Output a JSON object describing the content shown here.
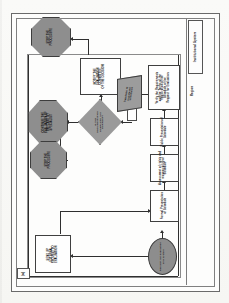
{
  "figure": {
    "number_label": "(a)",
    "orientation": "rotated-90-ccw",
    "type": "swimlane-flowchart"
  },
  "lanes": {
    "header_label": "Institutional System",
    "region_label": "Region"
  },
  "nodes": [
    {
      "id": "stop-top",
      "shape": "octagon",
      "fill": "#8e8e8e",
      "lines": [
        "STOP THE",
        "PROCEDURE"
      ]
    },
    {
      "id": "stop-mid-upper",
      "shape": "octagon",
      "fill": "#8e8e8e",
      "lines": [
        "CONTINUE THE",
        "EVALUATION OF",
        "THE CASE BY",
        "SPECIALIST"
      ]
    },
    {
      "id": "stop-mid-lower",
      "shape": "octagon",
      "fill": "#8e8e8e",
      "lines": [
        "STOP THE",
        "PROCEDURE"
      ]
    },
    {
      "id": "decision",
      "shape": "diamond",
      "fill": "#9a9a9a",
      "lines": [
        "IS THE",
        "DOCUMENTATION",
        "COMPLETE AND",
        "CORRECT?"
      ]
    },
    {
      "id": "notify-box",
      "shape": "rectangle",
      "fill": "#fefefe",
      "lines": [
        "NOTIFY THE",
        "EVALUATION",
        "COMMITTEE",
        "OF THE DECISION"
      ]
    },
    {
      "id": "data-para",
      "shape": "parallelogram",
      "fill": "#9c9c9c",
      "lines": [
        "Database of",
        "registered",
        "schedules"
      ]
    },
    {
      "id": "verify-box",
      "shape": "rectangle",
      "fill": "#fefefe",
      "lines": [
        "Verify the Requirements",
        "and the Terms of the",
        "Registration of the",
        "Schedule of the",
        "Request for Evaluation"
      ]
    },
    {
      "id": "public-presentation",
      "shape": "rectangle",
      "fill": "#fefefe",
      "lines": [
        "Public Presentation of",
        "Schedule"
      ]
    },
    {
      "id": "assessment-rights",
      "shape": "rectangle",
      "fill": "#fefefe",
      "lines": [
        "Assessment of rights and",
        "responsibility of",
        "Schedule"
      ]
    },
    {
      "id": "formal-presentation",
      "shape": "rectangle",
      "fill": "#fefefe",
      "lines": [
        "Formal Presentation",
        "of Schedule"
      ]
    },
    {
      "id": "start-terminator",
      "shape": "ellipse",
      "fill": "#8d8d8d",
      "lines": [
        "Request for evaluation",
        "of a system"
      ]
    },
    {
      "id": "external-box",
      "shape": "rectangle",
      "fill": "#fefefe",
      "lines": [
        "SEND UP",
        "EXTERNAL",
        "REQUEST TO",
        "EVALUATION"
      ]
    },
    {
      "id": "blank-connector",
      "shape": "rectangle-blank",
      "fill": "#fefefe",
      "lines": []
    }
  ],
  "colors": {
    "shape_fill_dark": "#8e8e8e",
    "shape_fill_mid": "#9a9a9a",
    "shape_fill_light": "#fefefe",
    "stroke": "#3d3d3d",
    "connector": "#2f2f2f",
    "frame": "#6a6a6a",
    "page_background": "#fbfbfa"
  }
}
